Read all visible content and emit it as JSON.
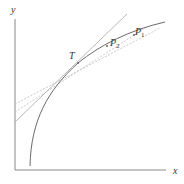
{
  "figure": {
    "axes": {
      "y_label": "y",
      "x_label": "x",
      "color": "#888888"
    },
    "curve": {
      "description": "increasing concave curve",
      "color": "#666666"
    },
    "tangent_line": {
      "label_point": "T",
      "color": "#aaaaaa"
    },
    "secant_lines": [
      {
        "through": "P1",
        "style": "dashed",
        "color": "#bbbbbb"
      },
      {
        "through": "P2",
        "style": "dashed",
        "color": "#bbbbbb"
      }
    ],
    "points": [
      {
        "name": "T",
        "base": "T",
        "sub": ""
      },
      {
        "name": "P2",
        "base": "P",
        "sub": "2"
      },
      {
        "name": "P1",
        "base": "P",
        "sub": "1"
      }
    ]
  }
}
